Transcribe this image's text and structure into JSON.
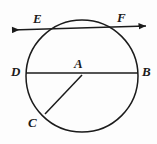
{
  "figure": {
    "kind": "circle-geometry-diagram",
    "background_color": "#fdfdfd",
    "stroke_color": "#1b1b1b",
    "label_color": "#1b1b1b"
  },
  "circle": {
    "name": "circle-A",
    "center_x": 82,
    "center_y": 76,
    "radius": 56
  },
  "labels": {
    "center": "A",
    "diameter_left": "D",
    "diameter_right": "B",
    "chord_left": "E",
    "chord_right": "F",
    "radius_end": "C"
  },
  "segments": [
    {
      "name": "diameter-DB",
      "label": "DB",
      "kind": "diameter",
      "x1": 26,
      "y1": 73,
      "x2": 138,
      "y2": 73
    },
    {
      "name": "chord-EF-line",
      "label": "EF",
      "kind": "secant-line-with-arrows",
      "x1": 12,
      "y1": 30,
      "x2": 146,
      "y2": 26
    },
    {
      "name": "radius-AC",
      "label": "AC",
      "kind": "radius",
      "x1": 82,
      "y1": 75,
      "x2": 45,
      "y2": 114
    }
  ],
  "points": [
    {
      "name": "point-A",
      "label": "A",
      "x": 82,
      "y": 75,
      "position": "center"
    },
    {
      "name": "point-D",
      "label": "D",
      "x": 26,
      "y": 73,
      "position": "circle-left"
    },
    {
      "name": "point-B",
      "label": "B",
      "x": 138,
      "y": 73,
      "position": "circle-right"
    },
    {
      "name": "point-E",
      "label": "E",
      "x": 40,
      "y": 29,
      "position": "circle-upper-left"
    },
    {
      "name": "point-F",
      "label": "F",
      "x": 124,
      "y": 27,
      "position": "circle-upper-right"
    },
    {
      "name": "point-C",
      "label": "C",
      "x": 45,
      "y": 114,
      "position": "circle-lower-left"
    }
  ],
  "label_positions": {
    "E": {
      "x": 33,
      "y": 12
    },
    "F": {
      "x": 117,
      "y": 11
    },
    "D": {
      "x": 11,
      "y": 65
    },
    "B": {
      "x": 142,
      "y": 65
    },
    "A": {
      "x": 74,
      "y": 57
    },
    "C": {
      "x": 28,
      "y": 116
    }
  }
}
